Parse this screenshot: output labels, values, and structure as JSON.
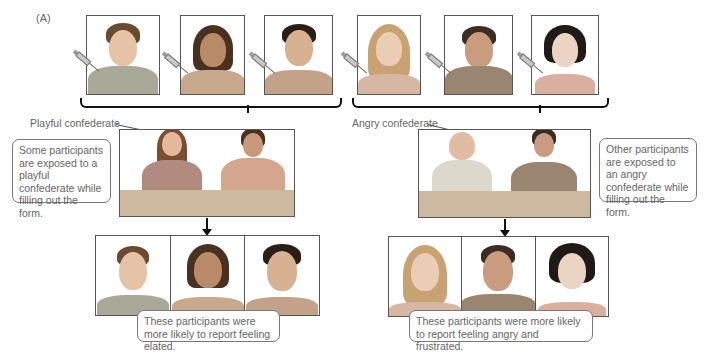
{
  "panel_label": "(A)",
  "top_row": {
    "left_group": [
      {
        "description": "young man, short brown hair, polo shirt",
        "hair": "#6b4a32",
        "skin": "#e6c3a6",
        "shirt": "#a9a99a",
        "injection": "syringe-icon"
      },
      {
        "description": "young woman, dark shoulder-length hair",
        "hair": "#4a3020",
        "skin": "#b98a68",
        "shirt": "#c9a98e",
        "injection": "syringe-icon"
      },
      {
        "description": "young man, dark hair",
        "hair": "#2b1e16",
        "skin": "#d8b192",
        "shirt": "#c4a28a",
        "injection": "syringe-icon"
      }
    ],
    "right_group": [
      {
        "description": "young woman, blonde hair",
        "hair": "#c9a274",
        "skin": "#ebcdb6",
        "shirt": "#d6b7a4",
        "injection": "syringe-icon"
      },
      {
        "description": "man, dark hair, button shirt",
        "hair": "#3d2c22",
        "skin": "#c99c80",
        "shirt": "#9a8570",
        "injection": "syringe-icon"
      },
      {
        "description": "young woman, black bob hair",
        "hair": "#1f1a18",
        "skin": "#ecd4c4",
        "shirt": "#d9b0a0",
        "injection": "syringe-icon"
      }
    ]
  },
  "conditions": {
    "playful": {
      "confederate_label": "Playful confederate",
      "callout": "Some participants are exposed to a playful confederate while filling out the form.",
      "result": "These participants were more likely to report feeling elated.",
      "results_faces": [
        {
          "description": "man smiling slightly",
          "hair": "#6b4a32",
          "skin": "#e6c3a6",
          "shirt": "#a9a99a"
        },
        {
          "description": "woman smiling",
          "hair": "#4a3020",
          "skin": "#b98a68",
          "shirt": "#c9a98e"
        },
        {
          "description": "man grinning",
          "hair": "#2b1e16",
          "skin": "#d8b192",
          "shirt": "#c4a28a"
        }
      ]
    },
    "angry": {
      "confederate_label": "Angry confederate",
      "callout": "Other participants are exposed to an angry confederate while filling out the form.",
      "result": "These participants were more likely to report feeling angry and frustrated.",
      "results_faces": [
        {
          "description": "woman shouting",
          "hair": "#c9a274",
          "skin": "#ebcdb6",
          "shirt": "#d6b7a4"
        },
        {
          "description": "man scowling",
          "hair": "#3d2c22",
          "skin": "#c99c80",
          "shirt": "#9a8570"
        },
        {
          "description": "woman frowning",
          "hair": "#1f1a18",
          "skin": "#ecd4c4",
          "shirt": "#d9b0a0"
        }
      ]
    }
  },
  "colors": {
    "frame": "#555555",
    "brace": "#111111",
    "table": "#cdb8a0",
    "text": "#666666"
  }
}
